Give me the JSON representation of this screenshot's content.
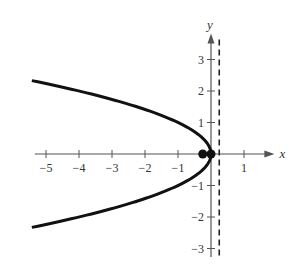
{
  "chart_data": {
    "type": "line",
    "title": "",
    "xlabel": "x",
    "ylabel": "y",
    "xlim": [
      -5.4,
      1.8
    ],
    "ylim": [
      -3.4,
      3.7
    ],
    "grid": false,
    "x_ticks": [
      -5,
      -4,
      -3,
      -2,
      -1,
      1
    ],
    "x_tick_labels": [
      "−5",
      "−4",
      "−3",
      "−2",
      "−1",
      "1"
    ],
    "y_ticks": [
      3,
      2,
      1,
      -1,
      -2,
      -3
    ],
    "y_tick_labels": [
      "3",
      "2",
      "1",
      "−1",
      "−2",
      "−3"
    ],
    "series": [
      {
        "name": "parabola",
        "equation": "y^2 = -x",
        "style": "solid",
        "color": "#111111",
        "y_range": [
          -2.33,
          2.33
        ]
      },
      {
        "name": "directrix",
        "equation": "x = 0.25",
        "style": "dashed",
        "color": "#222222"
      }
    ],
    "points": [
      {
        "name": "vertex",
        "x": 0,
        "y": 0
      },
      {
        "name": "focus",
        "x": -0.25,
        "y": 0
      }
    ]
  }
}
